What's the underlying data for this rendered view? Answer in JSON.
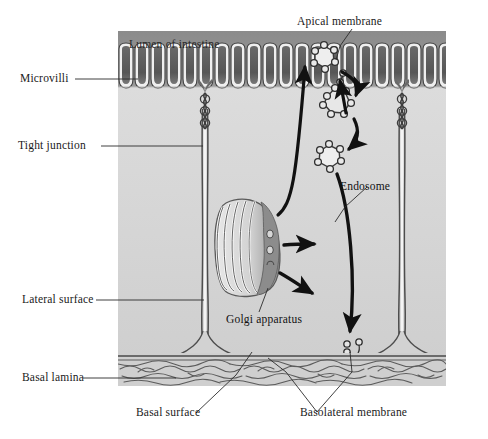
{
  "figure": {
    "domain_colors": {
      "lumen": "#909090",
      "cytoplasm": "#d8d8d8",
      "membrane_line": "#4a4a4a",
      "membrane_highlight": "#f2f2f2",
      "basal_lamina": "#cfcfcf",
      "arrow": "#111111",
      "label_text": "#1a1a1a",
      "golgi_dark": "#8d8d8d",
      "golgi_light": "#efefef",
      "microvilli_core": "#5f5f5f"
    }
  },
  "labels": {
    "apical_membrane": "Apical membrane",
    "lumen_of_intestine": "Lumen of intestine",
    "microvilli": "Microvilli",
    "tight_junction": "Tight  junction",
    "lateral_surface": "Lateral surface",
    "basal_lamina": "Basal lamina",
    "endosome": "Endosome",
    "golgi_apparatus": "Golgi apparatus",
    "basal_surface": "Basal surface",
    "basolateral_membrane": "Basolateral membrane"
  },
  "structures": {
    "microvilli_count": 20,
    "lateral_surfaces": 2,
    "tight_junctions": 2,
    "transport_vesicles": 3,
    "endosomes": 1,
    "apical_vesicles": 1,
    "basal_vesicles": 2,
    "transport_arrows": 6
  }
}
